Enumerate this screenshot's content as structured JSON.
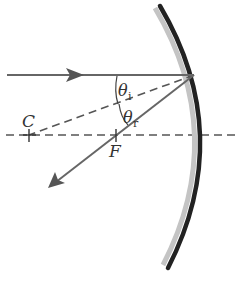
{
  "diagram": {
    "type": "concave mirror reflection",
    "labels": {
      "center": "C",
      "focal_point": "F",
      "theta": "θ",
      "incident_sub": "i",
      "reflected_sub": "r"
    },
    "colors": {
      "ray": "#666666",
      "mirror_back": "#222222",
      "mirror_front": "#c4c4c4",
      "axis": "#555555",
      "text": "#333333"
    },
    "elements": [
      "incident ray (horizontal, arrow right)",
      "reflected ray (arrow down-left through F)",
      "normal line (dashed, from reflection point to C)",
      "optical axis (dashed horizontal)",
      "concave mirror arc"
    ]
  }
}
